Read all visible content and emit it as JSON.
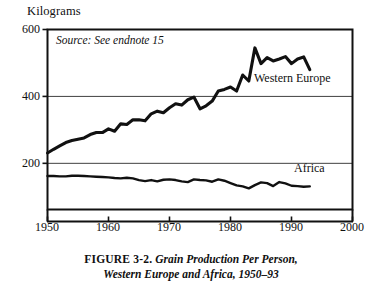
{
  "figure": {
    "y_axis_unit": "Kilograms",
    "source_note": "Source: See endnote 15",
    "caption_figure_number": "FIGURE 3-2.",
    "caption_line1": "Grain Production Per Person,",
    "caption_line2": "Western Europe and Africa, 1950–93",
    "label_western_europe": "Western Europe",
    "label_africa": "Africa"
  },
  "chart_data": {
    "type": "line",
    "title": "Grain Production Per Person, Western Europe and Africa, 1950–93",
    "subtitle": "",
    "xlabel": "",
    "ylabel": "Kilograms",
    "xlim": [
      1950,
      2000
    ],
    "ylim": [
      62,
      600
    ],
    "xticks": [
      1950,
      1960,
      1970,
      1980,
      1990,
      2000
    ],
    "yticks": [
      200,
      400,
      600
    ],
    "grid": "horizontal gridlines at 200 and 400",
    "legend_position": "inline labels next to each series",
    "annotations": [
      {
        "text": "Source: See endnote 15",
        "x": 1951.5,
        "y": 560
      },
      {
        "text": "Western Europe",
        "x": 1984,
        "y": 445
      },
      {
        "text": "Africa",
        "x": 1987,
        "y": 183
      }
    ],
    "x": [
      1950,
      1951,
      1952,
      1953,
      1954,
      1955,
      1956,
      1957,
      1958,
      1959,
      1960,
      1961,
      1962,
      1963,
      1964,
      1965,
      1966,
      1967,
      1968,
      1969,
      1970,
      1971,
      1972,
      1973,
      1974,
      1975,
      1976,
      1977,
      1978,
      1979,
      1980,
      1981,
      1982,
      1983,
      1984,
      1985,
      1986,
      1987,
      1988,
      1989,
      1990,
      1991,
      1992,
      1993
    ],
    "series": [
      {
        "name": "Western Europe",
        "values": [
          231,
          242,
          252,
          262,
          268,
          272,
          276,
          286,
          292,
          292,
          303,
          296,
          318,
          316,
          330,
          330,
          327,
          348,
          356,
          351,
          366,
          378,
          374,
          390,
          398,
          363,
          372,
          386,
          416,
          421,
          428,
          416,
          464,
          446,
          545,
          498,
          516,
          506,
          512,
          519,
          498,
          512,
          518,
          480
        ]
      },
      {
        "name": "Africa",
        "values": [
          162,
          162,
          161,
          161,
          163,
          163,
          162,
          161,
          160,
          159,
          158,
          156,
          155,
          157,
          155,
          150,
          147,
          150,
          146,
          151,
          152,
          150,
          146,
          144,
          152,
          150,
          149,
          145,
          152,
          148,
          141,
          134,
          131,
          125,
          135,
          143,
          141,
          132,
          144,
          140,
          133,
          132,
          130,
          131
        ]
      }
    ]
  }
}
